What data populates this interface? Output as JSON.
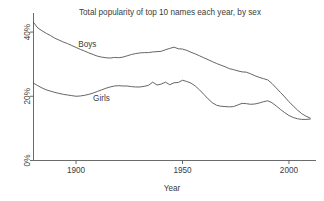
{
  "chart_data": {
    "type": "line",
    "title": "Total popularity of top 10 names each year, by sex",
    "xlabel": "Year",
    "ylabel": "",
    "xlim": [
      1880,
      2012
    ],
    "ylim": [
      0,
      45
    ],
    "grid": false,
    "legend_position": "inline-annotation",
    "xticks": [
      1900,
      1950,
      2000
    ],
    "xtick_labels": [
      "1900",
      "1950",
      "2000"
    ],
    "yticks": [
      0,
      20,
      40
    ],
    "ytick_labels": [
      "0%",
      "20%",
      "40%"
    ],
    "annotations": [
      {
        "text": "Boys",
        "x": 1901,
        "y": 35.5
      },
      {
        "text": "Girls",
        "x": 1908,
        "y": 18.6
      }
    ],
    "x": [
      1880,
      1882,
      1884,
      1886,
      1888,
      1890,
      1892,
      1894,
      1896,
      1898,
      1900,
      1902,
      1904,
      1906,
      1908,
      1910,
      1912,
      1914,
      1916,
      1918,
      1920,
      1922,
      1924,
      1926,
      1928,
      1930,
      1932,
      1934,
      1936,
      1938,
      1940,
      1942,
      1944,
      1946,
      1948,
      1950,
      1952,
      1954,
      1956,
      1958,
      1960,
      1962,
      1964,
      1966,
      1968,
      1970,
      1972,
      1974,
      1976,
      1978,
      1980,
      1982,
      1984,
      1986,
      1988,
      1990,
      1992,
      1994,
      1996,
      1998,
      2000,
      2002,
      2004,
      2006,
      2008,
      2010
    ],
    "series": [
      {
        "name": "Boys",
        "color": "#4a4a4a",
        "values": [
          43.0,
          41.3,
          40.4,
          39.6,
          38.9,
          38.1,
          37.5,
          36.9,
          36.4,
          35.8,
          35.2,
          34.6,
          34.1,
          33.5,
          33.0,
          32.5,
          32.2,
          32.0,
          31.9,
          32.1,
          32.0,
          32.2,
          32.6,
          33.0,
          33.3,
          33.5,
          33.6,
          33.6,
          33.8,
          33.9,
          34.0,
          34.5,
          34.9,
          35.3,
          34.8,
          34.7,
          34.3,
          33.7,
          33.2,
          32.6,
          32.0,
          31.4,
          30.8,
          30.2,
          29.7,
          29.2,
          28.6,
          28.3,
          27.9,
          27.6,
          27.5,
          27.0,
          26.4,
          25.9,
          25.5,
          25.1,
          24.0,
          22.6,
          21.2,
          19.8,
          18.3,
          17.0,
          15.7,
          14.6,
          13.8,
          13.2
        ]
      },
      {
        "name": "Girls",
        "color": "#4a4a4a",
        "values": [
          24.1,
          23.3,
          22.6,
          22.0,
          21.6,
          21.2,
          20.9,
          20.6,
          20.4,
          20.2,
          20.0,
          20.1,
          20.3,
          20.6,
          21.0,
          21.5,
          22.0,
          22.5,
          22.9,
          23.2,
          23.3,
          23.2,
          23.2,
          23.0,
          22.9,
          22.9,
          23.1,
          23.4,
          24.4,
          23.5,
          23.8,
          24.4,
          23.6,
          24.2,
          24.3,
          25.0,
          24.6,
          24.1,
          23.2,
          22.0,
          20.6,
          19.2,
          18.0,
          17.2,
          16.9,
          16.8,
          16.7,
          16.8,
          17.3,
          17.8,
          17.7,
          17.5,
          17.6,
          17.9,
          18.3,
          18.6,
          18.0,
          17.0,
          15.9,
          14.9,
          14.0,
          13.4,
          13.0,
          12.8,
          12.8,
          12.9
        ]
      }
    ]
  }
}
